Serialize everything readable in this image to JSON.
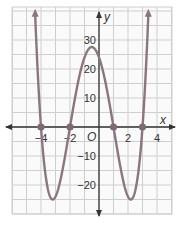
{
  "chart_data": {
    "type": "line",
    "title": "",
    "xlabel": "x",
    "ylabel": "y",
    "function": "y = (x+4)(x+2)(x-1)(x-3)",
    "xlim": [
      -6,
      5
    ],
    "ylim": [
      -30,
      40
    ],
    "grid": true,
    "x_ticks": [
      {
        "value": -4,
        "label": "−4"
      },
      {
        "value": -2,
        "label": "−2"
      },
      {
        "value": 2,
        "label": "2"
      },
      {
        "value": 4,
        "label": "4"
      }
    ],
    "y_ticks": [
      {
        "value": 30,
        "label": "30"
      },
      {
        "value": 20,
        "label": "20"
      },
      {
        "value": 10,
        "label": "10"
      },
      {
        "value": -10,
        "label": "−10"
      },
      {
        "value": -20,
        "label": "−20"
      }
    ],
    "origin_label": "O",
    "zeros": [
      {
        "x": -4,
        "y": 0
      },
      {
        "x": -2,
        "y": 0
      },
      {
        "x": 1,
        "y": 0
      },
      {
        "x": 3,
        "y": 0
      }
    ],
    "key_points": [
      {
        "x": -3.2,
        "y": -25,
        "note": "local minimum"
      },
      {
        "x": -0.5,
        "y": 27.6,
        "note": "local maximum"
      },
      {
        "x": 2.2,
        "y": -25,
        "note": "local minimum"
      },
      {
        "x": 0,
        "y": 24,
        "note": "y-intercept"
      }
    ],
    "colors": {
      "curve": "#8a7580",
      "axis": "#333333",
      "grid": "#cfcfcf",
      "points": "#7d6a73"
    }
  }
}
